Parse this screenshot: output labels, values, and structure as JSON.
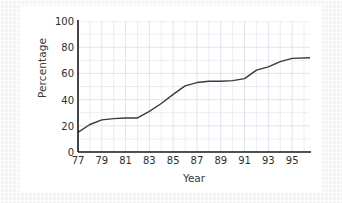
{
  "chart_data": {
    "type": "line",
    "title": "",
    "xlabel": "Year",
    "ylabel": "Percentage",
    "xlim": [
      77,
      96.5
    ],
    "ylim": [
      0,
      100
    ],
    "grid": true,
    "legend": false,
    "y_ticks": [
      0,
      20,
      40,
      60,
      80,
      100
    ],
    "y_tick_labels": [
      "0",
      "20",
      "40",
      "60",
      "80",
      "100"
    ],
    "x_ticks": [
      77,
      79,
      81,
      83,
      85,
      87,
      89,
      91,
      93,
      95
    ],
    "x_tick_labels": [
      "77",
      "79",
      "81",
      "83",
      "85",
      "87",
      "89",
      "91",
      "93",
      "95"
    ],
    "line_color": "#3a3a3a",
    "grid_color": "#d6dde8",
    "axis_color": "#1a1a1a",
    "background": "#ffffff",
    "x": [
      77,
      78,
      79,
      80,
      81,
      82,
      83,
      84,
      85,
      86,
      87,
      88,
      89,
      90,
      91,
      92,
      93,
      94,
      95,
      96.5
    ],
    "values": [
      15,
      21,
      24.5,
      25.5,
      26,
      26,
      31,
      37,
      44,
      50.5,
      53,
      54,
      54,
      54.5,
      56,
      62.5,
      65,
      69,
      71.5,
      72
    ],
    "series": [
      {
        "name": "Percentage",
        "values": [
          15,
          21,
          24.5,
          25.5,
          26,
          26,
          31,
          37,
          44,
          50.5,
          53,
          54,
          54,
          54.5,
          56,
          62.5,
          65,
          69,
          71.5,
          72
        ]
      }
    ]
  }
}
